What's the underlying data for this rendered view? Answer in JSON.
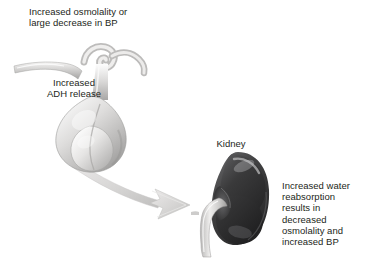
{
  "figure": {
    "background_color": "#ffffff",
    "text_color": "#231f20"
  },
  "labels": {
    "stimulus": "Increased osmolality or\nlarge decrease in BP",
    "adh_release": "Increased\nADH release",
    "kidney": "Kidney",
    "effect": "Increased water\nreabsorption\nresults in\ndecreased\nosmolality and\nincreased BP"
  },
  "structures": [
    {
      "name": "pituitary-gland",
      "label": "Increased ADH release",
      "fill_light": "#f2f1f0",
      "fill_mid": "#cfcecd",
      "fill_shadow": "#a9a8a7"
    },
    {
      "name": "kidney",
      "label": "Kidney",
      "fill_dark": "#2c2c2d",
      "fill_mid": "#4a4a4c",
      "highlight": "#9a9a9c"
    },
    {
      "name": "ureter",
      "fill_light": "#e3e2e1",
      "fill_shadow": "#b0afae"
    },
    {
      "name": "flow-arrow",
      "direction": "pituitary-to-kidney",
      "fill": "#d5d4d3",
      "edge": "#b7b6b5"
    }
  ]
}
